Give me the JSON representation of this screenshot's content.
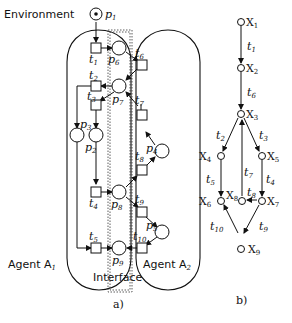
{
  "panel_a": {
    "caption": "a)",
    "labels": {
      "environment": "Environment",
      "agent1": "Agent A",
      "agent1_sub": "1",
      "agent2": "Agent A",
      "agent2_sub": "2",
      "interface": "Interface"
    },
    "places": {
      "p1": {
        "name": "p",
        "sub": "1"
      },
      "p2": {
        "name": "p",
        "sub": "2"
      },
      "p3": {
        "name": "p",
        "sub": "3"
      },
      "p4": {
        "name": "p",
        "sub": "4"
      },
      "p5": {
        "name": "p",
        "sub": "5"
      },
      "p6": {
        "name": "p",
        "sub": "6"
      },
      "p7": {
        "name": "p",
        "sub": "7"
      },
      "p8": {
        "name": "p",
        "sub": "8"
      },
      "p9": {
        "name": "p",
        "sub": "9"
      }
    },
    "transitions": {
      "t1": {
        "name": "t",
        "sub": "1"
      },
      "t2": {
        "name": "t",
        "sub": "2"
      },
      "t3": {
        "name": "t",
        "sub": "3"
      },
      "t4": {
        "name": "t",
        "sub": "4"
      },
      "t5": {
        "name": "t",
        "sub": "5"
      },
      "t6": {
        "name": "t",
        "sub": "6"
      },
      "t7": {
        "name": "t",
        "sub": "7"
      },
      "t8": {
        "name": "t",
        "sub": "8"
      },
      "t9": {
        "name": "t",
        "sub": "9"
      },
      "t10": {
        "name": "t",
        "sub": "10"
      }
    }
  },
  "panel_b": {
    "caption": "b)",
    "states": {
      "x1": {
        "name": "X",
        "sub": "1"
      },
      "x2": {
        "name": "X",
        "sub": "2"
      },
      "x3": {
        "name": "X",
        "sub": "3"
      },
      "x4": {
        "name": "X",
        "sub": "4"
      },
      "x5": {
        "name": "X",
        "sub": "5"
      },
      "x6": {
        "name": "X",
        "sub": "6"
      },
      "x7": {
        "name": "X",
        "sub": "7"
      },
      "x8": {
        "name": "X",
        "sub": "8"
      },
      "x9": {
        "name": "X",
        "sub": "9"
      }
    },
    "edges": {
      "e1": {
        "name": "t",
        "sub": "1"
      },
      "e6": {
        "name": "t",
        "sub": "6"
      },
      "e2": {
        "name": "t",
        "sub": "2"
      },
      "e3": {
        "name": "t",
        "sub": "3"
      },
      "e5": {
        "name": "t",
        "sub": "5"
      },
      "e7": {
        "name": "t",
        "sub": "7"
      },
      "e4": {
        "name": "t",
        "sub": "4"
      },
      "e8": {
        "name": "t",
        "sub": "8"
      },
      "e10": {
        "name": "t",
        "sub": "10"
      },
      "e9": {
        "name": "t",
        "sub": "9"
      }
    }
  }
}
